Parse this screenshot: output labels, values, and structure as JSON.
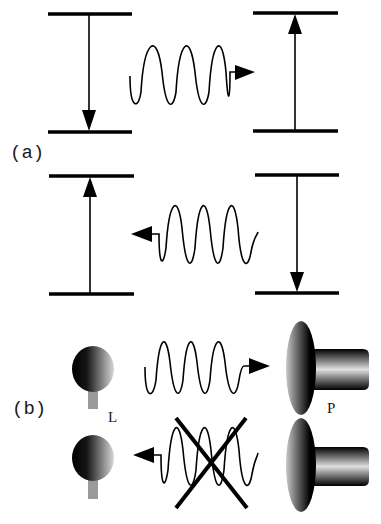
{
  "figure": {
    "panel_a": {
      "label": "(a)",
      "top_row": {
        "left_transition": {
          "direction": "down",
          "description": "emission (downward transition)"
        },
        "photon": {
          "direction": "right",
          "periods": 3
        },
        "right_transition": {
          "direction": "up",
          "description": "absorption (upward transition)"
        }
      },
      "bottom_row": {
        "left_transition": {
          "direction": "up",
          "description": "absorption (upward transition)"
        },
        "photon": {
          "direction": "left",
          "periods": 3
        },
        "right_transition": {
          "direction": "down",
          "description": "emission (downward transition)"
        }
      }
    },
    "panel_b": {
      "label": "(b)",
      "ligand_label": "L",
      "protein_label": "P",
      "top_row": {
        "photon": {
          "direction": "right",
          "periods": 3,
          "blocked": false
        }
      },
      "bottom_row": {
        "photon": {
          "direction": "left",
          "periods": 3,
          "blocked": true
        }
      }
    }
  },
  "colors": {
    "ink": "#000000",
    "background": "#ffffff",
    "stem": "#9a9a9a",
    "gradient_dark": "#000000",
    "gradient_light": "#d8d8d8"
  }
}
